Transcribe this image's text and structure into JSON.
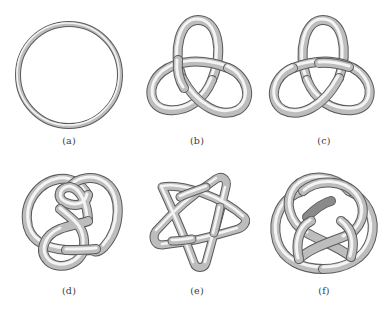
{
  "figure": {
    "background": "#ffffff",
    "tube_colors": {
      "shadow": "#5a5a5a",
      "body": "#bdbdbd",
      "highlight": "#f4f4f4"
    },
    "panels": [
      {
        "id": "a",
        "caption": "(a)",
        "depicts": "unknot (circle)"
      },
      {
        "id": "b",
        "caption": "(b)",
        "depicts": "trefoil knot"
      },
      {
        "id": "c",
        "caption": "(c)",
        "depicts": "trefoil knot (mirror image)"
      },
      {
        "id": "d",
        "caption": "(d)",
        "depicts": "figure-eight knot"
      },
      {
        "id": "e",
        "caption": "(e)",
        "depicts": "cinquefoil (star) knot"
      },
      {
        "id": "f",
        "caption": "(f)",
        "depicts": "complex knot"
      }
    ]
  }
}
